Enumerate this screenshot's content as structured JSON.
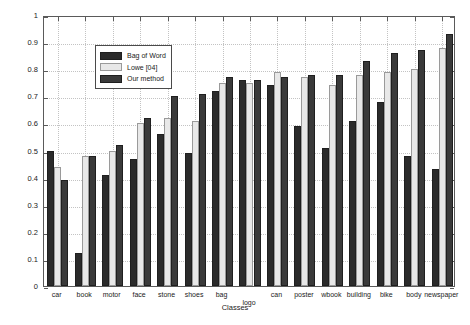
{
  "chart_data": {
    "type": "bar",
    "title": "",
    "xlabel": "Classes",
    "ylabel": "F-measure",
    "ylim": [
      0,
      1
    ],
    "yticks": [
      0,
      0.1,
      0.2,
      0.3,
      0.4,
      0.5,
      0.6,
      0.7,
      0.8,
      0.9,
      1
    ],
    "ytick_labels": [
      "0",
      "0.1",
      "0.2",
      "0.3",
      "0.4",
      "0.5",
      "0.6",
      "0.7",
      "0.8",
      "0.9",
      "1"
    ],
    "grid": true,
    "legend_position": "upper-left-inside",
    "categories": [
      "car",
      "book",
      "motor",
      "face",
      "stone",
      "shoes",
      "bag",
      "logo",
      "can",
      "poster",
      "wbook",
      "building",
      "bike",
      "body",
      "newspaper"
    ],
    "series": [
      {
        "name": "Bag of Word",
        "color": "#2b2b2b",
        "values": [
          0.5,
          0.12,
          0.41,
          0.47,
          0.56,
          0.49,
          0.72,
          0.76,
          0.74,
          0.59,
          0.51,
          0.61,
          0.68,
          0.48,
          0.43
        ]
      },
      {
        "name": "Lowe [04]",
        "color": "#e8e8e8",
        "values": [
          0.44,
          0.48,
          0.5,
          0.6,
          0.62,
          0.61,
          0.75,
          0.75,
          0.79,
          0.77,
          0.74,
          0.78,
          0.79,
          0.8,
          0.88
        ]
      },
      {
        "name": "Our method",
        "color": "#3a3a3a",
        "values": [
          0.39,
          0.48,
          0.52,
          0.62,
          0.7,
          0.71,
          0.77,
          0.76,
          0.77,
          0.78,
          0.78,
          0.83,
          0.86,
          0.87,
          0.93
        ]
      }
    ]
  },
  "legend": {
    "items": [
      {
        "label": "Bag of Word",
        "color": "#2b2b2b"
      },
      {
        "label": "Lowe [04]",
        "color": "#e8e8e8"
      },
      {
        "label": "Our method",
        "color": "#3a3a3a"
      }
    ]
  },
  "axes": {
    "y_title": "F-measure",
    "x_title": "Classes"
  }
}
